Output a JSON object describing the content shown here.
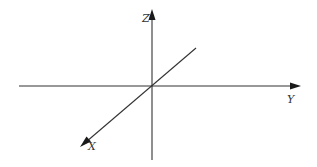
{
  "diagram": {
    "type": "3d-coordinate-axes",
    "origin": {
      "x": 152,
      "y": 86
    },
    "colors": {
      "axis": "#333333",
      "arrowhead": "#1a1a1a",
      "background": "#ffffff"
    },
    "axes": [
      {
        "name": "Y",
        "label": "Y",
        "direction": "right"
      },
      {
        "name": "Z",
        "label": "Z",
        "direction": "up"
      },
      {
        "name": "X",
        "label": "X",
        "direction": "down-left"
      }
    ]
  }
}
